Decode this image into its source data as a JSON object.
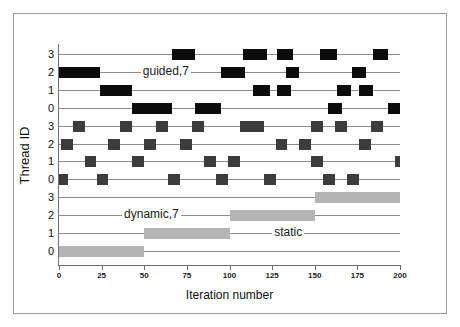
{
  "chart_data": {
    "type": "bar",
    "title": "",
    "subtitle": "",
    "xlabel": "Iteration number",
    "ylabel": "Thread ID",
    "xlim": [
      0,
      200
    ],
    "xticks": [
      0,
      25,
      50,
      75,
      100,
      125,
      150,
      175,
      200
    ],
    "xticklabels": [
      "0",
      "25",
      "50",
      "75",
      "100",
      "125",
      "150",
      "175",
      "200"
    ],
    "grid": false,
    "legend_position": "inline-annotations",
    "orientation": "horizontal-gantt",
    "yticklabels": [
      "3",
      "2",
      "1",
      "0",
      "3",
      "2",
      "1",
      "0",
      "3",
      "2",
      "1",
      "0"
    ],
    "annotations": [
      {
        "text": "guided,7",
        "x": 48,
        "lane": 1
      },
      {
        "text": "dynamic,7",
        "x": 37,
        "lane": 9
      },
      {
        "text": "static",
        "x": 125,
        "lane": 10
      }
    ],
    "colors": {
      "guided": "#0b0b0b",
      "dynamic": "#3c3c3c",
      "static": "#b4b4b4",
      "lane_line": "#8e8e8e",
      "axis": "#6f6f6f",
      "frame": "#9a9a9a",
      "background": "#ffffff"
    },
    "groups": [
      {
        "name": "guided,7",
        "schedule": "guided",
        "chunk_label": "7",
        "color": "#0b0b0b",
        "threads": [
          {
            "id": "3",
            "lane": 0,
            "chunks": [
              [
                66,
                80
              ],
              [
                108,
                122
              ],
              [
                128,
                137
              ],
              [
                153,
                163
              ],
              [
                184,
                193
              ]
            ]
          },
          {
            "id": "2",
            "lane": 1,
            "chunks": [
              [
                0,
                24
              ],
              [
                95,
                109
              ],
              [
                133,
                141
              ],
              [
                172,
                180
              ]
            ]
          },
          {
            "id": "1",
            "lane": 2,
            "chunks": [
              [
                24,
                43
              ],
              [
                114,
                124
              ],
              [
                128,
                136
              ],
              [
                163,
                171
              ],
              [
                176,
                184
              ]
            ]
          },
          {
            "id": "0",
            "lane": 3,
            "chunks": [
              [
                43,
                66
              ],
              [
                80,
                95
              ],
              [
                158,
                166
              ],
              [
                193,
                200
              ]
            ]
          }
        ]
      },
      {
        "name": "dynamic,7",
        "schedule": "dynamic",
        "chunk_label": "7",
        "color": "#3c3c3c",
        "threads": [
          {
            "id": "3",
            "lane": 4,
            "chunks": [
              [
                8,
                15
              ],
              [
                36,
                43
              ],
              [
                57,
                64
              ],
              [
                78,
                85
              ],
              [
                106,
                113
              ],
              [
                113,
                120
              ],
              [
                148,
                155
              ],
              [
                162,
                169
              ],
              [
                183,
                190
              ]
            ]
          },
          {
            "id": "2",
            "lane": 5,
            "chunks": [
              [
                1,
                8
              ],
              [
                29,
                36
              ],
              [
                50,
                57
              ],
              [
                71,
                78
              ],
              [
                127,
                134
              ],
              [
                141,
                148
              ],
              [
                176,
                183
              ]
            ]
          },
          {
            "id": "1",
            "lane": 6,
            "chunks": [
              [
                15,
                22
              ],
              [
                43,
                50
              ],
              [
                85,
                92
              ],
              [
                99,
                106
              ],
              [
                148,
                155
              ],
              [
                197,
                200
              ]
            ]
          },
          {
            "id": "0",
            "lane": 7,
            "chunks": [
              [
                0,
                5
              ],
              [
                22,
                29
              ],
              [
                64,
                71
              ],
              [
                92,
                99
              ],
              [
                120,
                127
              ],
              [
                155,
                162
              ],
              [
                169,
                176
              ]
            ]
          }
        ]
      },
      {
        "name": "static",
        "schedule": "static",
        "chunk_label": "",
        "color": "#b4b4b4",
        "threads": [
          {
            "id": "3",
            "lane": 8,
            "chunks": [
              [
                150,
                200
              ]
            ]
          },
          {
            "id": "2",
            "lane": 9,
            "chunks": [
              [
                100,
                150
              ]
            ]
          },
          {
            "id": "1",
            "lane": 10,
            "chunks": [
              [
                50,
                100
              ]
            ]
          },
          {
            "id": "0",
            "lane": 11,
            "chunks": [
              [
                0,
                50
              ]
            ]
          }
        ]
      }
    ]
  }
}
